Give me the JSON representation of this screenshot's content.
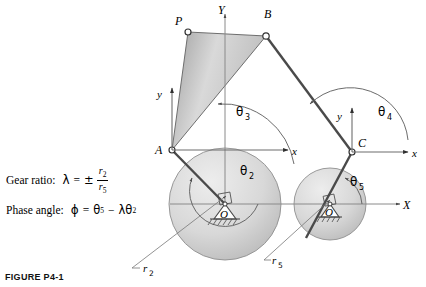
{
  "figure": {
    "caption": "FIGURE P4-1",
    "equations": [
      {
        "id": "gear-ratio",
        "label": "Gear ratio:",
        "symbol": "λ",
        "equals": "=",
        "sign": "±",
        "numerator": "r",
        "numerator_sub": "2",
        "denominator": "r",
        "denominator_sub": "5"
      },
      {
        "id": "phase-angle",
        "label": "Phase angle:",
        "symbol": "ϕ",
        "equals": "=",
        "rhs_first": "θ",
        "rhs_first_sub": "5",
        "minus": "−",
        "rhs_lambda": "λθ",
        "rhs_lambda_sub": "2"
      }
    ],
    "points": [
      {
        "name": "P",
        "label": "P",
        "x": 188,
        "y": 32
      },
      {
        "name": "B",
        "label": "B",
        "x": 266,
        "y": 36
      },
      {
        "name": "A",
        "label": "A",
        "x": 172,
        "y": 150
      },
      {
        "name": "C",
        "label": "C",
        "x": 352,
        "y": 152
      },
      {
        "name": "O2",
        "label": "O",
        "x": 225,
        "y": 204
      },
      {
        "name": "O5",
        "label": "O",
        "x": 330,
        "y": 204
      }
    ],
    "point_labels": {
      "p": "P",
      "b": "B",
      "a": "A",
      "c": "C",
      "o2": "O",
      "o5": "O"
    },
    "axes": {
      "global_y": "Y",
      "global_x": "X",
      "local_y_at_a": "y",
      "local_x_at_a": "x",
      "local_y_at_c": "y",
      "local_x_at_c": "x"
    },
    "angles": [
      {
        "name": "theta2",
        "label": "θ",
        "sub": "2",
        "x": 248,
        "y": 170
      },
      {
        "name": "theta3",
        "label": "θ",
        "sub": "3",
        "x": 244,
        "y": 111
      },
      {
        "name": "theta4",
        "label": "θ",
        "sub": "4",
        "x": 386,
        "y": 111
      },
      {
        "name": "theta5",
        "label": "θ",
        "sub": "5",
        "x": 358,
        "y": 180
      }
    ],
    "radii": [
      {
        "name": "r2",
        "label": "r",
        "sub": "2",
        "x": 148,
        "y": 265
      },
      {
        "name": "r5",
        "label": "r",
        "sub": "5",
        "x": 277,
        "y": 257
      }
    ],
    "colors": {
      "link_fill_light": "#e6e6e6",
      "link_fill_dark": "#9d9d9d",
      "gear_fill_light": "#e2e2e2",
      "gear_fill_dark": "#b9b9b9",
      "stroke": "#3a3a3a",
      "axis": "#7c7c7c",
      "text": "#000000"
    }
  }
}
